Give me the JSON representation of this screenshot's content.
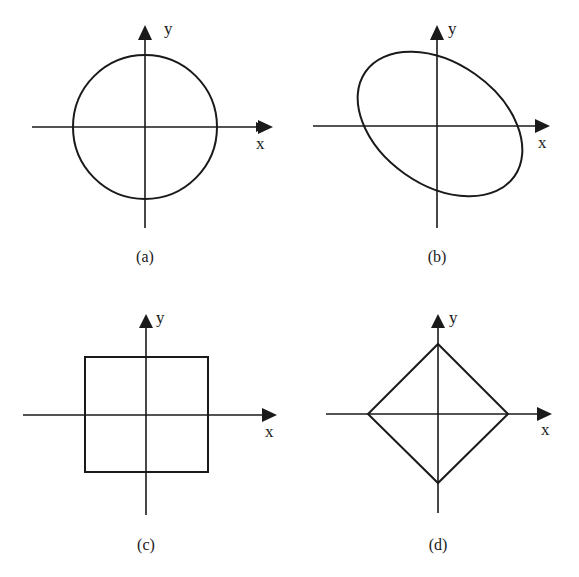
{
  "figure": {
    "panels": [
      {
        "id": "a",
        "caption": "(a)",
        "shape": "circle",
        "x_label": "x",
        "y_label": "y"
      },
      {
        "id": "b",
        "caption": "(b)",
        "shape": "rotated-ellipse",
        "x_label": "x",
        "y_label": "y"
      },
      {
        "id": "c",
        "caption": "(c)",
        "shape": "square",
        "x_label": "x",
        "y_label": "y"
      },
      {
        "id": "d",
        "caption": "(d)",
        "shape": "diamond",
        "x_label": "x",
        "y_label": "y"
      }
    ]
  },
  "colors": {
    "ink": "#1a1a1a",
    "background": "#ffffff"
  }
}
